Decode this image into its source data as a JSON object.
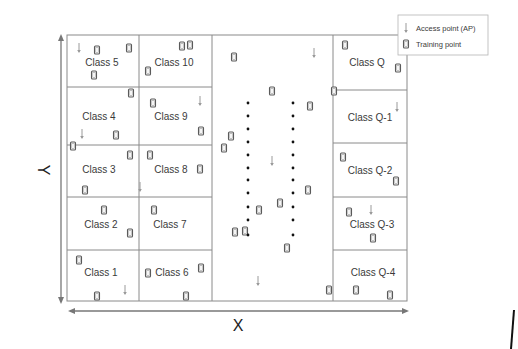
{
  "figure": {
    "type": "indoor-localization-grid-diagram",
    "axes": {
      "x_label": "X",
      "y_label": "Y"
    },
    "legend": {
      "items": [
        {
          "icon": "access-point-icon",
          "label": "Access point (AP)"
        },
        {
          "icon": "training-point-icon",
          "label": "Training point"
        }
      ]
    },
    "columns": [
      {
        "name": "left-column-1",
        "classes": [
          "Class 5",
          "Class 4",
          "Class 3",
          "Class 2",
          "Class 1"
        ]
      },
      {
        "name": "left-column-2",
        "classes": [
          "Class 10",
          "Class 9",
          "Class 8",
          "Class 7",
          "Class 6"
        ]
      },
      {
        "name": "middle-column",
        "classes": [],
        "ellipsis": "vertical dots indicating more classes"
      },
      {
        "name": "right-column",
        "classes": [
          "Class Q",
          "Class Q-1",
          "Class Q-2",
          "Class Q-3",
          "Class Q-4"
        ]
      }
    ],
    "colors": {
      "grid": "#8a8a8a",
      "training_point": "#5a5a5a",
      "access_point": "#9a9a9a",
      "dots": "#111111",
      "text": "#3a3a3a"
    }
  }
}
